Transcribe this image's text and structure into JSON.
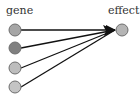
{
  "diagram": {
    "source_label": "gene",
    "target_label": "effect",
    "sources": [
      {
        "id": "g1",
        "x": 15,
        "y": 30,
        "fill": "#a6a6a6"
      },
      {
        "id": "g2",
        "x": 15,
        "y": 48,
        "fill": "#808080"
      },
      {
        "id": "g3",
        "x": 15,
        "y": 68,
        "fill": "#bdbdbd"
      },
      {
        "id": "g4",
        "x": 15,
        "y": 87,
        "fill": "#c4c4c4"
      }
    ],
    "target": {
      "x": 122,
      "y": 30,
      "fill": "#b5b5b5"
    },
    "edge_color": "#111111",
    "node_stroke": "#6e6e6e",
    "node_radius": 6
  }
}
